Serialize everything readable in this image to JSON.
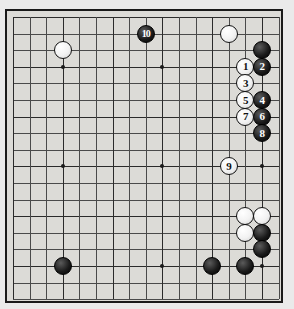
{
  "app": {
    "title": "Go Game Diagram",
    "board_label": "go-board",
    "background_color": "#eaeaea",
    "board_color": "#dcdbd7",
    "line_color": "#4a4a4a",
    "border_color": "#1a1a1a"
  },
  "board": {
    "columns": 17,
    "rows": 18,
    "cell_size": 16.6,
    "origin_x": 11,
    "origin_y": 15,
    "star_points": [
      {
        "col": 3,
        "row": 3
      },
      {
        "col": 9,
        "row": 3
      },
      {
        "col": 15,
        "row": 3
      },
      {
        "col": 3,
        "row": 9
      },
      {
        "col": 9,
        "row": 9
      },
      {
        "col": 15,
        "row": 9
      },
      {
        "col": 3,
        "row": 15
      },
      {
        "col": 9,
        "row": 15
      },
      {
        "col": 15,
        "row": 15
      }
    ]
  },
  "stones": [
    {
      "id": "white-upper-left",
      "color": "white",
      "col": 3,
      "row": 2,
      "label": ""
    },
    {
      "id": "white-upper-right",
      "color": "white",
      "col": 13,
      "row": 1,
      "label": ""
    },
    {
      "id": "black-upper-right-corner",
      "color": "black",
      "col": 15,
      "row": 2,
      "label": ""
    },
    {
      "id": "black-lower-left",
      "color": "black",
      "col": 3,
      "row": 15,
      "label": ""
    },
    {
      "id": "white-lower-right-a",
      "color": "white",
      "col": 14,
      "row": 12,
      "label": ""
    },
    {
      "id": "white-lower-right-b",
      "color": "white",
      "col": 15,
      "row": 12,
      "label": ""
    },
    {
      "id": "white-lower-right-c",
      "color": "white",
      "col": 14,
      "row": 13,
      "label": ""
    },
    {
      "id": "black-lower-right-a",
      "color": "black",
      "col": 15,
      "row": 13,
      "label": ""
    },
    {
      "id": "black-lower-right-b",
      "color": "black",
      "col": 15,
      "row": 14,
      "label": ""
    },
    {
      "id": "black-bottom-a",
      "color": "black",
      "col": 12,
      "row": 15,
      "label": ""
    },
    {
      "id": "black-bottom-b",
      "color": "black",
      "col": 14,
      "row": 15,
      "label": ""
    },
    {
      "id": "move-1",
      "color": "white",
      "col": 14,
      "row": 3,
      "label": "1"
    },
    {
      "id": "move-2",
      "color": "black",
      "col": 15,
      "row": 3,
      "label": "2"
    },
    {
      "id": "move-3",
      "color": "white",
      "col": 14,
      "row": 4,
      "label": "3"
    },
    {
      "id": "move-4",
      "color": "black",
      "col": 15,
      "row": 5,
      "label": "4"
    },
    {
      "id": "move-5",
      "color": "white",
      "col": 14,
      "row": 5,
      "label": "5"
    },
    {
      "id": "move-6",
      "color": "black",
      "col": 15,
      "row": 6,
      "label": "6"
    },
    {
      "id": "move-7",
      "color": "white",
      "col": 14,
      "row": 6,
      "label": "7"
    },
    {
      "id": "move-8",
      "color": "black",
      "col": 15,
      "row": 7,
      "label": "8"
    },
    {
      "id": "move-9",
      "color": "white",
      "col": 13,
      "row": 9,
      "label": "9"
    },
    {
      "id": "move-10",
      "color": "black",
      "col": 8,
      "row": 1,
      "label": "10"
    }
  ]
}
